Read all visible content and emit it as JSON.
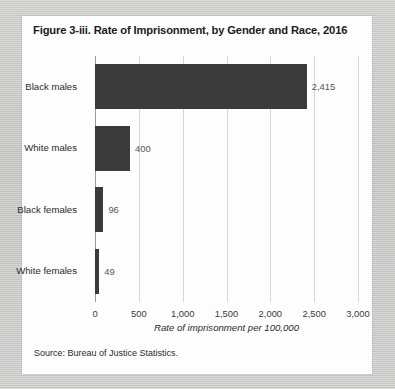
{
  "figure": {
    "title": "Figure 3-iii. Rate of Imprisonment, by Gender and Race, 2016",
    "source": "Source: Bureau of Justice Statistics."
  },
  "chart_data": {
    "type": "bar",
    "orientation": "horizontal",
    "title": "Figure 3-iii. Rate of Imprisonment, by Gender and Race, 2016",
    "categories": [
      "Black males",
      "White males",
      "Black females",
      "White females"
    ],
    "values": [
      2415,
      400,
      96,
      49
    ],
    "value_labels": [
      "2,415",
      "400",
      "96",
      "49"
    ],
    "xlabel": "Rate of imprisonment per 100,000",
    "ylabel": "",
    "xlim": [
      0,
      3000
    ],
    "xticks": [
      0,
      500,
      1000,
      1500,
      2000,
      2500,
      3000
    ],
    "xtick_labels": [
      "0",
      "500",
      "1,000",
      "1,500",
      "2,000",
      "2,500",
      "3,000"
    ],
    "grid": "vertical",
    "legend": "none",
    "bar_color": "#3a3a3a",
    "gridline_color": "#d8d8d8"
  }
}
